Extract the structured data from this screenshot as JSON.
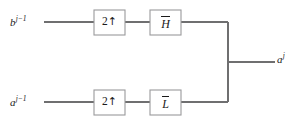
{
  "diagram": {
    "type": "block-diagram",
    "background_color": "#ffffff",
    "wire_color": "#6f6f70",
    "box_border_color": "#9a9a9c",
    "text_color": "#1a1a1a",
    "inputs": [
      {
        "id": "input-top",
        "base": "b",
        "superscript": "j−1",
        "full_text": "b j−1",
        "x": 10,
        "y": 16
      },
      {
        "id": "input-bottom",
        "base": "a",
        "superscript": "j−1",
        "full_text": "a j−1",
        "x": 10,
        "y": 96
      }
    ],
    "outputs": [
      {
        "id": "output-right",
        "base": "a",
        "superscript": "j",
        "full_text": "a j",
        "x": 277,
        "y": 52
      }
    ],
    "blocks": [
      {
        "id": "upsampler-top",
        "name": "upsampler",
        "label": "2",
        "arrow": "↑",
        "overbar": false,
        "x": 94,
        "y": 10,
        "width": 31,
        "height": 25
      },
      {
        "id": "filter-high",
        "name": "highpass-filter",
        "label": "H",
        "arrow": "",
        "overbar": true,
        "x": 150,
        "y": 10,
        "width": 31,
        "height": 25
      },
      {
        "id": "upsampler-bottom",
        "name": "upsampler",
        "label": "2",
        "arrow": "↑",
        "overbar": false,
        "x": 94,
        "y": 90,
        "width": 31,
        "height": 25
      },
      {
        "id": "filter-low",
        "name": "lowpass-filter",
        "label": "L",
        "arrow": "",
        "overbar": true,
        "x": 150,
        "y": 90,
        "width": 31,
        "height": 25
      }
    ],
    "wires": [
      {
        "id": "wire-top-in",
        "d": "M 44 22 L 94 22"
      },
      {
        "id": "wire-top-mid",
        "d": "M 125 22 L 150 22"
      },
      {
        "id": "wire-top-out",
        "d": "M 181 22 L 228 22"
      },
      {
        "id": "wire-bottom-in",
        "d": "M 44 102 L 94 102"
      },
      {
        "id": "wire-bottom-mid",
        "d": "M 125 102 L 150 102"
      },
      {
        "id": "wire-bottom-out",
        "d": "M 181 102 L 228 102"
      },
      {
        "id": "wire-junction",
        "d": "M 228 22 L 228 102"
      },
      {
        "id": "wire-output",
        "d": "M 228 62 L 275 62"
      }
    ]
  }
}
